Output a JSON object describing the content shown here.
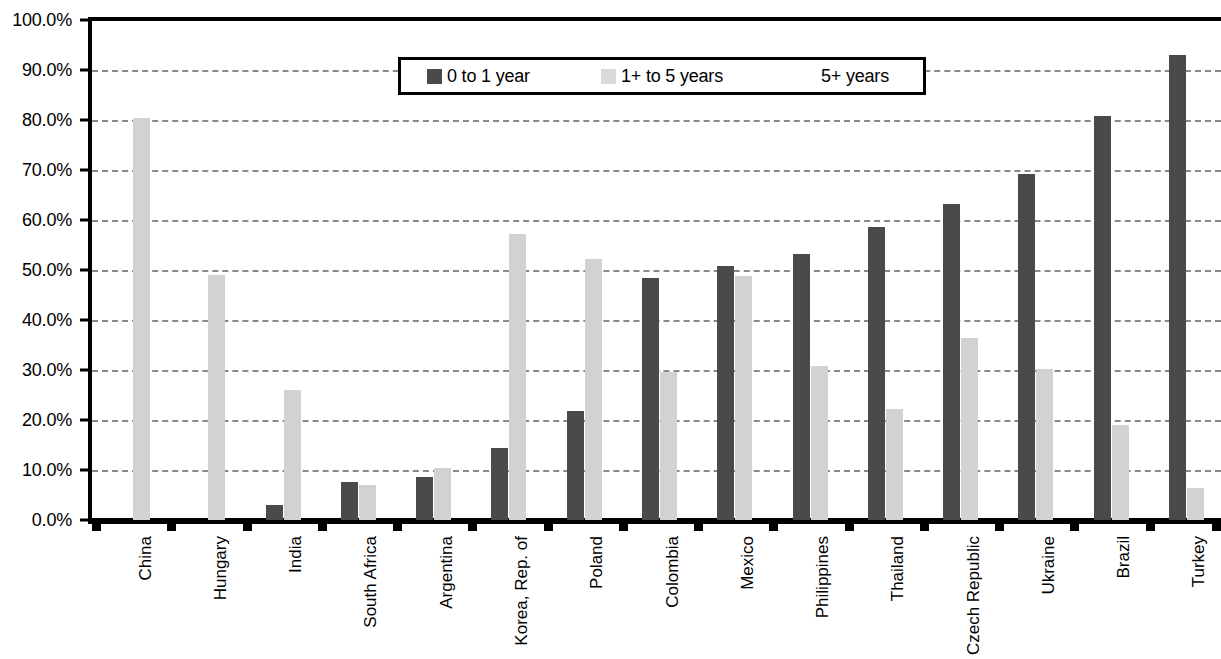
{
  "chart_data": {
    "type": "bar",
    "title": "",
    "xlabel": "",
    "ylabel": "",
    "ylim": [
      0,
      100
    ],
    "ytick_labels": [
      "100.0%",
      "90.0%",
      "80.0%",
      "70.0%",
      "60.0%",
      "50.0%",
      "40.0%",
      "30.0%",
      "20.0%",
      "10.0%",
      "0.0%"
    ],
    "ytick_values": [
      100,
      90,
      80,
      70,
      60,
      50,
      40,
      30,
      20,
      10,
      0
    ],
    "grid": true,
    "legend_position": "top-center",
    "categories": [
      "China",
      "Hungary",
      "India",
      "South Africa",
      "Argentina",
      "Korea, Rep. of",
      "Poland",
      "Colombia",
      "Mexico",
      "Philippines",
      "Thailand",
      "Czech Republic",
      "Ukraine",
      "Brazil",
      "Turkey"
    ],
    "series": [
      {
        "name": "0 to 1 year",
        "color": "#4a4a4a",
        "values": [
          0,
          0,
          3.1,
          7.6,
          8.6,
          14.4,
          21.8,
          48.5,
          50.8,
          53.2,
          58.6,
          63.3,
          69.2,
          80.9,
          93.0
        ]
      },
      {
        "name": "1+ to 5 years",
        "color": "#d2d2d2",
        "values": [
          80.5,
          49.0,
          26.1,
          7.1,
          10.5,
          57.2,
          52.2,
          29.7,
          48.9,
          30.9,
          22.2,
          36.5,
          30.3,
          19.0,
          6.4
        ]
      },
      {
        "name": "5+ years",
        "color": "#ffffff",
        "values": [
          0,
          0,
          0,
          0,
          0,
          0,
          0,
          0,
          0,
          0,
          0,
          0,
          0,
          0,
          0
        ]
      }
    ]
  },
  "legend": {
    "entries": [
      {
        "label": "0 to 1 year",
        "swatch": "dark"
      },
      {
        "label": "1+ to 5 years",
        "swatch": "light"
      },
      {
        "label": "5+ years",
        "swatch": "none"
      }
    ]
  }
}
